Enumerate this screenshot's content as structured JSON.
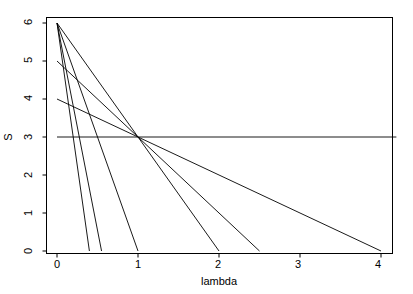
{
  "chart_data": {
    "type": "line",
    "title": "",
    "xlabel": "lambda",
    "ylabel": "S",
    "xlim": [
      -0.14,
      4.19
    ],
    "ylim": [
      -0.26,
      6.25
    ],
    "xticks": [
      0,
      1,
      2,
      3,
      4
    ],
    "xticklabels": [
      "0",
      "1",
      "2",
      "3",
      "4"
    ],
    "yticks": [
      0,
      1,
      2,
      3,
      4,
      5,
      6
    ],
    "yticklabels": [
      "0",
      "1",
      "2",
      "3",
      "4",
      "5",
      "6"
    ],
    "grid": false,
    "legend": null,
    "box": true,
    "common_point": [
      1,
      3
    ],
    "line_color": "#000000",
    "series": [
      {
        "name": "line-1",
        "x": [
          0,
          0.4
        ],
        "y": [
          6,
          0
        ]
      },
      {
        "name": "line-2",
        "x": [
          0,
          0.55
        ],
        "y": [
          6,
          0
        ]
      },
      {
        "name": "line-3",
        "x": [
          0,
          1.0
        ],
        "y": [
          6,
          0
        ]
      },
      {
        "name": "line-4",
        "x": [
          0,
          2.0
        ],
        "y": [
          6,
          0
        ]
      },
      {
        "name": "line-5",
        "x": [
          0,
          2.5
        ],
        "y": [
          5,
          0
        ]
      },
      {
        "name": "line-6",
        "x": [
          0,
          4.0
        ],
        "y": [
          4,
          0
        ]
      },
      {
        "name": "line-7",
        "x": [
          0,
          4.19
        ],
        "y": [
          3,
          3
        ]
      }
    ]
  },
  "labels": {
    "xlabel": "lambda",
    "ylabel": "S",
    "x0": "0",
    "x1": "1",
    "x2": "2",
    "x3": "3",
    "x4": "4",
    "y0": "0",
    "y1": "1",
    "y2": "2",
    "y3": "3",
    "y4": "4",
    "y5": "5",
    "y6": "6"
  }
}
